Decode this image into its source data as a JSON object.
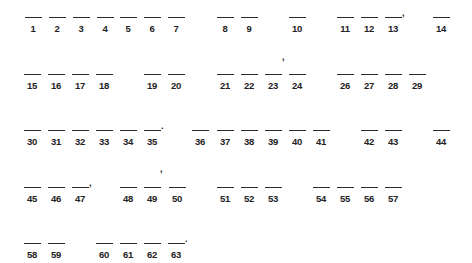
{
  "rows": [
    {
      "line_y": 17,
      "items": [
        {
          "n": "1",
          "x": 33
        },
        {
          "n": "2",
          "x": 57
        },
        {
          "n": "3",
          "x": 81
        },
        {
          "n": "4",
          "x": 105
        },
        {
          "n": "5",
          "x": 128
        },
        {
          "n": "6",
          "x": 152
        },
        {
          "n": "7",
          "x": 176
        },
        {
          "n": "8",
          "x": 225
        },
        {
          "n": "9",
          "x": 249
        },
        {
          "n": "10",
          "x": 297
        },
        {
          "n": "11",
          "x": 345
        },
        {
          "n": "12",
          "x": 369
        },
        {
          "n": "13",
          "x": 393,
          "punct": ","
        },
        {
          "n": "14",
          "x": 441
        }
      ]
    },
    {
      "line_y": 74,
      "items": [
        {
          "n": "15",
          "x": 32
        },
        {
          "n": "16",
          "x": 56
        },
        {
          "n": "17",
          "x": 80
        },
        {
          "n": "18",
          "x": 104
        },
        {
          "n": "19",
          "x": 152
        },
        {
          "n": "20",
          "x": 176
        },
        {
          "n": "21",
          "x": 225
        },
        {
          "n": "22",
          "x": 249
        },
        {
          "n": "23",
          "x": 273
        },
        {
          "n": "24",
          "x": 297
        },
        {
          "n": "26",
          "x": 345
        },
        {
          "n": "27",
          "x": 369
        },
        {
          "n": "28",
          "x": 393
        },
        {
          "n": "29",
          "x": 417
        }
      ]
    },
    {
      "line_y": 130,
      "items": [
        {
          "n": "30",
          "x": 32
        },
        {
          "n": "31",
          "x": 56
        },
        {
          "n": "32",
          "x": 80
        },
        {
          "n": "33",
          "x": 104
        },
        {
          "n": "34",
          "x": 128
        },
        {
          "n": "35",
          "x": 152,
          "punct": "."
        },
        {
          "n": "36",
          "x": 200
        },
        {
          "n": "37",
          "x": 225
        },
        {
          "n": "38",
          "x": 249
        },
        {
          "n": "39",
          "x": 273
        },
        {
          "n": "40",
          "x": 297
        },
        {
          "n": "41",
          "x": 321
        },
        {
          "n": "42",
          "x": 369
        },
        {
          "n": "43",
          "x": 393
        },
        {
          "n": "44",
          "x": 441
        }
      ]
    },
    {
      "line_y": 187,
      "items": [
        {
          "n": "45",
          "x": 32
        },
        {
          "n": "46",
          "x": 56
        },
        {
          "n": "47",
          "x": 80,
          "punct": ","
        },
        {
          "n": "48",
          "x": 128
        },
        {
          "n": "49",
          "x": 152
        },
        {
          "n": "50",
          "x": 177
        },
        {
          "n": "51",
          "x": 225
        },
        {
          "n": "52",
          "x": 249
        },
        {
          "n": "53",
          "x": 273
        },
        {
          "n": "54",
          "x": 321
        },
        {
          "n": "55",
          "x": 345
        },
        {
          "n": "56",
          "x": 369
        },
        {
          "n": "57",
          "x": 393
        }
      ]
    },
    {
      "line_y": 243,
      "items": [
        {
          "n": "58",
          "x": 32
        },
        {
          "n": "59",
          "x": 56
        },
        {
          "n": "60",
          "x": 104
        },
        {
          "n": "61",
          "x": 128
        },
        {
          "n": "62",
          "x": 152
        },
        {
          "n": "63",
          "x": 176,
          "punct": "."
        }
      ]
    }
  ],
  "floating_marks": [
    {
      "char": ",",
      "x": 282,
      "y": 52
    },
    {
      "char": ",",
      "x": 160,
      "y": 164
    }
  ]
}
